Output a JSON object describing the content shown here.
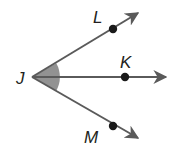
{
  "diagram": {
    "type": "angle-rays",
    "colors": {
      "ray": "#5a5a5a",
      "point": "#1a1a1a",
      "angle_shade": "#7f7f7f",
      "label": "#231f20"
    },
    "vertex": {
      "name": "J",
      "label": "J"
    },
    "rays": [
      {
        "id": "ray-JL",
        "through": "L",
        "label": "L"
      },
      {
        "id": "ray-JK",
        "through": "K",
        "label": "K"
      },
      {
        "id": "ray-JM",
        "through": "M",
        "label": "M"
      }
    ],
    "shaded_angle": "∠LJM"
  }
}
